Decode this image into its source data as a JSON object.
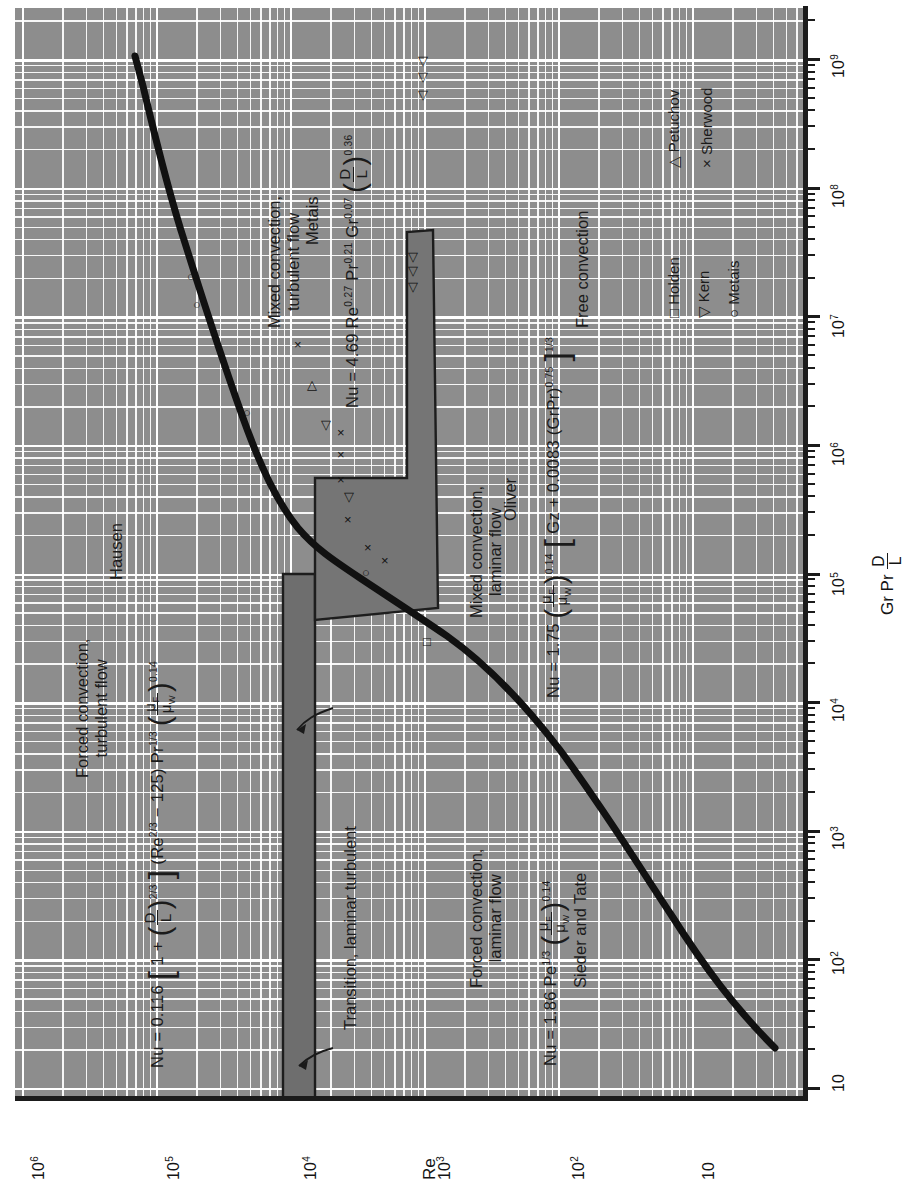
{
  "figure": {
    "orientation": "rotated-90-ccw",
    "background_color": "#8d8d8d",
    "gridline_color": "#ffffff",
    "ink_color": "#1b1b1b",
    "band_color": "#6f6f6f"
  },
  "axes": {
    "x": {
      "title_parts": {
        "lead": "Gr Pr",
        "num": "D",
        "den": "L"
      },
      "ticks": [
        "10",
        "10",
        "10",
        "10",
        "10",
        "10",
        "10",
        "10",
        "10"
      ],
      "tick_exponents": [
        "",
        "2",
        "3",
        "4",
        "5",
        "6",
        "7",
        "8",
        "9"
      ],
      "min": 10,
      "max": 1000000000,
      "scale": "log"
    },
    "y": {
      "title": "Re",
      "ticks": [
        "10",
        "10",
        "10",
        "10",
        "10",
        "10"
      ],
      "tick_exponents": [
        "",
        "2",
        "3",
        "4",
        "5",
        "6"
      ],
      "min": 4,
      "max": 1000000,
      "scale": "log"
    }
  },
  "regions": {
    "forced_turbulent": {
      "label_line1": "Forced convection,",
      "label_line2": "turbulent flow",
      "formula": "Nu = 0.116 [1 + (D/L)^(2/3)] (Re^(2/3) − 125) Pr^(1/3) (μF/μW)^0.14",
      "nu_lead": "Nu = 0.116",
      "coef_one_plus": "1 +",
      "dl_num": "D",
      "dl_den": "L",
      "dl_exp": "2/3",
      "re_term": "(Re",
      "re_exp": "2/3",
      "minus125": "− 125)",
      "pr": "Pr",
      "pr_exp": "1/3",
      "mu_num": "μ",
      "mu_num_sub": "F",
      "mu_den": "μ",
      "mu_den_sub": "W",
      "mu_exp": "0.14",
      "author": "Hausen"
    },
    "mixed_turbulent": {
      "label_line1": "Mixed convection,",
      "label_line2": "turbulent flow",
      "formula": "Nu = 4.69 Re^0.27 Pr^0.21 Gr^0.07 (D/L)^0.36",
      "nu_lead": "Nu = 4.69 Re",
      "re_exp": "0.27",
      "pr": "Pr",
      "pr_exp": "0.21",
      "gr": "Gr",
      "gr_exp": "0.07",
      "dl_num": "D",
      "dl_den": "L",
      "dl_exp": "0.36",
      "author": "Metais"
    },
    "mixed_laminar": {
      "label_line1": "Mixed convection,",
      "label_line2": "laminar flow",
      "formula": "Nu = 1.75 (μF/μW)^0.14 [Gz + 0.0083 (GrPr)^0.75]^(1/3)",
      "nu_lead": "Nu = 1.75",
      "mu_num": "μ",
      "mu_num_sub": "F",
      "mu_den": "μ",
      "mu_den_sub": "W",
      "mu_exp": "0.14",
      "bracket_body": "Gz + 0.0083 (GrPr)",
      "grpr_exp": "0.75",
      "bracket_exp": "1/3",
      "author": "Oliver"
    },
    "forced_laminar": {
      "label_line1": "Forced convection,",
      "label_line2": "laminar flow",
      "formula": "Nu = 1.86 Pe^(1/3) (μF/μW)^0.14",
      "nu_lead": "Nu = 1.86 Pe",
      "pe_exp": "1/3",
      "mu_num": "μ",
      "mu_num_sub": "F",
      "mu_den": "μ",
      "mu_den_sub": "W",
      "mu_exp": "0.14",
      "author": "Sieder and Tate"
    },
    "free_convection": {
      "label": "Free convection"
    },
    "transition": {
      "label": "Transition, laminar turbulent"
    }
  },
  "legend": {
    "items": [
      {
        "marker": "□",
        "label": "Holden"
      },
      {
        "marker": "▽",
        "label": "Kern"
      },
      {
        "marker": "○",
        "label": "Metais"
      },
      {
        "marker": "△",
        "label": "Petuchov"
      },
      {
        "marker": "×",
        "label": "Sherwood"
      }
    ]
  },
  "chart_data": {
    "type": "line",
    "title": "",
    "xlabel": "Gr Pr D/L",
    "ylabel": "Re",
    "xscale": "log",
    "yscale": "log",
    "xlim": [
      10,
      1000000000
    ],
    "ylim": [
      4,
      1000000
    ],
    "grid": true,
    "legend_position": "lower-right",
    "series": [
      {
        "name": "regime boundary curve",
        "comment": "heavy black curve separating forced/mixed convection regimes",
        "x": [
          20,
          60,
          200,
          900,
          3000,
          7000,
          12000,
          22000,
          40000,
          120000,
          600000,
          3000000,
          20000000,
          90000000
        ],
        "y": [
          9,
          13,
          30,
          130,
          460,
          800,
          1100,
          1500,
          1900,
          2600,
          3600,
          5200,
          7800,
          13000
        ]
      }
    ],
    "points": [
      {
        "set": "Holden",
        "marker": "square",
        "x": 1100,
        "y": 480
      },
      {
        "set": "Metais",
        "marker": "circle",
        "x": 6500,
        "y": 800
      },
      {
        "set": "Metais",
        "marker": "circle",
        "x": 1300000,
        "y": 3900
      },
      {
        "set": "Metais",
        "marker": "circle",
        "x": 12000000,
        "y": 5700
      },
      {
        "set": "Metais",
        "marker": "circle",
        "x": 20000000,
        "y": 6200
      },
      {
        "set": "Sherwood",
        "marker": "cross",
        "x": 5500,
        "y": 620
      },
      {
        "set": "Sherwood",
        "marker": "cross",
        "x": 7000,
        "y": 780
      },
      {
        "set": "Sherwood",
        "marker": "cross",
        "x": 11000,
        "y": 1050
      },
      {
        "set": "Sherwood",
        "marker": "cross",
        "x": 16000,
        "y": 1250
      },
      {
        "set": "Sherwood",
        "marker": "cross",
        "x": 21000,
        "y": 1250
      },
      {
        "set": "Sherwood",
        "marker": "cross",
        "x": 27000,
        "y": 1250
      },
      {
        "set": "Sherwood",
        "marker": "cross",
        "x": 270000,
        "y": 2900
      },
      {
        "set": "Kern",
        "marker": "down-triangle",
        "x": 13000,
        "y": 1150
      },
      {
        "set": "Kern",
        "marker": "down-triangle",
        "x": 26000,
        "y": 1600
      },
      {
        "set": "Kern",
        "marker": "down-triangle",
        "x": 430000,
        "y": 900
      },
      {
        "set": "Kern",
        "marker": "down-triangle",
        "x": 560000,
        "y": 900
      },
      {
        "set": "Kern",
        "marker": "down-triangle",
        "x": 700000,
        "y": 900
      },
      {
        "set": "Kern",
        "marker": "down-triangle",
        "x": 6000000,
        "y": 980
      },
      {
        "set": "Kern",
        "marker": "down-triangle",
        "x": 8000000,
        "y": 980
      },
      {
        "set": "Kern",
        "marker": "down-triangle",
        "x": 11000000,
        "y": 980
      },
      {
        "set": "Petuchov",
        "marker": "up-triangle",
        "x": 70000,
        "y": 2150
      }
    ],
    "bands": [
      {
        "name": "transition laminar-turbulent",
        "orientation": "horizontal",
        "y_range": [
          2100,
          3100
        ]
      },
      {
        "name": "mixed convection laminar band",
        "orientation": "vertical-ish",
        "note": "narrow shaded tongue rising from Re~300 to Re~1000 across Gr Pr D/L 2e4 to 3e7"
      }
    ]
  }
}
